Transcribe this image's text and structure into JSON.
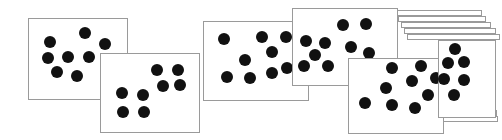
{
  "figure": {
    "title": "Overlapping cards with scattered black dots",
    "background_color": "#ffffff",
    "card_fill_color": "#ffffff",
    "card_border_color": "#9a9a9a",
    "dot_color": "#111111",
    "width": 502,
    "height": 140,
    "card_count": 6,
    "stack_edge_count": 8
  },
  "stack_edges": [
    {
      "name": "stack-edge-top-1",
      "x": 396,
      "y": 10,
      "w": 86,
      "h": 6
    },
    {
      "name": "stack-edge-top-2",
      "x": 398,
      "y": 16,
      "w": 88,
      "h": 6
    },
    {
      "name": "stack-edge-top-3",
      "x": 401,
      "y": 22,
      "w": 90,
      "h": 6
    },
    {
      "name": "stack-edge-top-4",
      "x": 404,
      "y": 28,
      "w": 92,
      "h": 6
    },
    {
      "name": "stack-edge-top-5",
      "x": 407,
      "y": 34,
      "w": 93,
      "h": 6
    },
    {
      "name": "stack-edge-bottom-1",
      "x": 430,
      "y": 104,
      "w": 66,
      "h": 6
    },
    {
      "name": "stack-edge-bottom-2",
      "x": 433,
      "y": 110,
      "w": 64,
      "h": 6
    },
    {
      "name": "stack-edge-bottom-3",
      "x": 436,
      "y": 116,
      "w": 62,
      "h": 6
    }
  ],
  "cards": [
    {
      "name": "card-1",
      "label": "Card 1",
      "x": 28,
      "y": 18,
      "w": 100,
      "h": 82,
      "dot_count": 7,
      "dot_radius": 6,
      "dots": [
        {
          "cx": 50,
          "cy": 42
        },
        {
          "cx": 85,
          "cy": 33
        },
        {
          "cx": 105,
          "cy": 44
        },
        {
          "cx": 48,
          "cy": 58
        },
        {
          "cx": 68,
          "cy": 57
        },
        {
          "cx": 89,
          "cy": 57
        },
        {
          "cx": 57,
          "cy": 72
        },
        {
          "cx": 77,
          "cy": 76
        }
      ]
    },
    {
      "name": "card-2",
      "label": "Card 2",
      "x": 100,
      "y": 53,
      "w": 100,
      "h": 80,
      "dot_count": 8,
      "dot_radius": 6,
      "dots": [
        {
          "cx": 157,
          "cy": 70
        },
        {
          "cx": 178,
          "cy": 70
        },
        {
          "cx": 163,
          "cy": 86
        },
        {
          "cx": 180,
          "cy": 85
        },
        {
          "cx": 122,
          "cy": 93
        },
        {
          "cx": 143,
          "cy": 95
        },
        {
          "cx": 123,
          "cy": 112
        },
        {
          "cx": 144,
          "cy": 112
        }
      ]
    },
    {
      "name": "card-3",
      "label": "Card 3",
      "x": 203,
      "y": 21,
      "w": 106,
      "h": 80,
      "dot_count": 9,
      "dot_radius": 6,
      "dots": [
        {
          "cx": 224,
          "cy": 39
        },
        {
          "cx": 262,
          "cy": 37
        },
        {
          "cx": 286,
          "cy": 37
        },
        {
          "cx": 272,
          "cy": 52
        },
        {
          "cx": 245,
          "cy": 60
        },
        {
          "cx": 287,
          "cy": 68
        },
        {
          "cx": 227,
          "cy": 77
        },
        {
          "cx": 250,
          "cy": 78
        },
        {
          "cx": 272,
          "cy": 73
        }
      ]
    },
    {
      "name": "card-4",
      "label": "Card 4",
      "x": 292,
      "y": 8,
      "w": 106,
      "h": 78,
      "dot_count": 9,
      "dot_radius": 6,
      "dots": [
        {
          "cx": 343,
          "cy": 25
        },
        {
          "cx": 366,
          "cy": 24
        },
        {
          "cx": 306,
          "cy": 41
        },
        {
          "cx": 325,
          "cy": 43
        },
        {
          "cx": 351,
          "cy": 47
        },
        {
          "cx": 315,
          "cy": 55
        },
        {
          "cx": 369,
          "cy": 53
        },
        {
          "cx": 304,
          "cy": 66
        },
        {
          "cx": 328,
          "cy": 66
        }
      ]
    },
    {
      "name": "card-5",
      "label": "Card 5",
      "x": 348,
      "y": 58,
      "w": 96,
      "h": 76,
      "dot_count": 9,
      "dot_radius": 6,
      "dots": [
        {
          "cx": 392,
          "cy": 68
        },
        {
          "cx": 421,
          "cy": 66
        },
        {
          "cx": 412,
          "cy": 81
        },
        {
          "cx": 386,
          "cy": 88
        },
        {
          "cx": 428,
          "cy": 95
        },
        {
          "cx": 365,
          "cy": 103
        },
        {
          "cx": 392,
          "cy": 105
        },
        {
          "cx": 415,
          "cy": 108
        },
        {
          "cx": 436,
          "cy": 78
        }
      ]
    },
    {
      "name": "card-6",
      "label": "Card 6",
      "x": 438,
      "y": 40,
      "w": 58,
      "h": 78,
      "dot_count": 6,
      "dot_radius": 6,
      "dots": [
        {
          "cx": 455,
          "cy": 49
        },
        {
          "cx": 448,
          "cy": 63
        },
        {
          "cx": 464,
          "cy": 62
        },
        {
          "cx": 444,
          "cy": 79
        },
        {
          "cx": 464,
          "cy": 80
        },
        {
          "cx": 454,
          "cy": 95
        }
      ]
    }
  ]
}
